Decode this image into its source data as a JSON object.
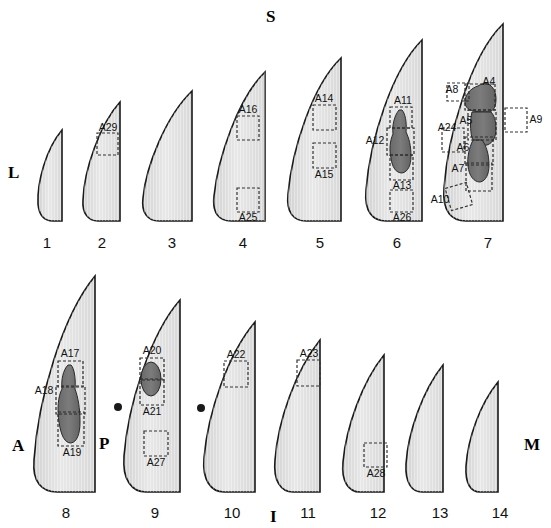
{
  "figure": {
    "background_color": "#ffffff",
    "outline_color": "#1a1a1a",
    "fill_light": "#e3e3e3",
    "fill_dark": "#6e6e6e",
    "roi_box_color": "#333333",
    "section_count": 14
  },
  "orientation": {
    "superior": "S",
    "inferior": "I",
    "lateral": "L",
    "medial": "M",
    "anterior": "A",
    "posterior": "P"
  },
  "rows": [
    {
      "name": "top-row",
      "numbers": [
        "1",
        "2",
        "3",
        "4",
        "5",
        "6",
        "7"
      ]
    },
    {
      "name": "bottom-row",
      "numbers": [
        "8",
        "9",
        "10",
        "11",
        "12",
        "13",
        "14"
      ]
    }
  ],
  "sections": [
    {
      "number": "1",
      "rois": []
    },
    {
      "number": "2",
      "rois": [
        "A29"
      ]
    },
    {
      "number": "3",
      "rois": []
    },
    {
      "number": "4",
      "rois": [
        "A16",
        "A25"
      ]
    },
    {
      "number": "5",
      "rois": [
        "A14",
        "A15"
      ]
    },
    {
      "number": "6",
      "rois": [
        "A11",
        "A12",
        "A13",
        "A26"
      ]
    },
    {
      "number": "7",
      "rois": [
        "A4",
        "A5",
        "A6",
        "A7",
        "A8",
        "A9",
        "A10",
        "A24"
      ]
    },
    {
      "number": "8",
      "rois": [
        "A17",
        "A18",
        "A19"
      ]
    },
    {
      "number": "9",
      "rois": [
        "A20",
        "A21",
        "A27"
      ]
    },
    {
      "number": "10",
      "rois": [
        "A22"
      ]
    },
    {
      "number": "11",
      "rois": [
        "A23"
      ]
    },
    {
      "number": "12",
      "rois": [
        "A28"
      ]
    },
    {
      "number": "13",
      "rois": []
    },
    {
      "number": "14",
      "rois": []
    }
  ],
  "roi_labels": {
    "A4": "A4",
    "A5": "A5",
    "A6": "A6",
    "A7": "A7",
    "A8": "A8",
    "A9": "A9",
    "A10": "A10",
    "A11": "A11",
    "A12": "A12",
    "A13": "A13",
    "A14": "A14",
    "A15": "A15",
    "A16": "A16",
    "A17": "A17",
    "A18": "A18",
    "A19": "A19",
    "A20": "A20",
    "A21": "A21",
    "A22": "A22",
    "A23": "A23",
    "A24": "A24",
    "A25": "A25",
    "A26": "A26",
    "A27": "A27",
    "A28": "A28",
    "A29": "A29"
  }
}
